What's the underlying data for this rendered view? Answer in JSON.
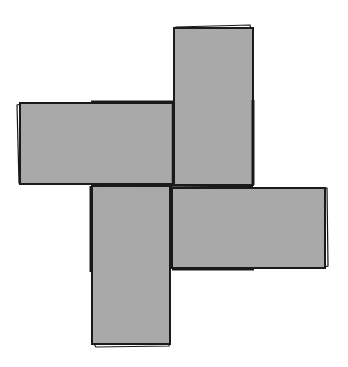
{
  "diagram": {
    "title": "",
    "colors": {
      "fill": "#a9a9a9",
      "stroke": "#1a1a1a",
      "background": "#ffffff",
      "shadow_edge": "#ffffff"
    },
    "rectangles": [
      {
        "id": "top",
        "x": 174,
        "y": 27,
        "w": 79,
        "h": 158
      },
      {
        "id": "left",
        "x": 19,
        "y": 103,
        "w": 154,
        "h": 81
      },
      {
        "id": "right",
        "x": 172,
        "y": 188,
        "w": 154,
        "h": 80
      },
      {
        "id": "bottom",
        "x": 92,
        "y": 186,
        "w": 78,
        "h": 159
      }
    ],
    "center": {
      "x": 172,
      "y": 186
    }
  }
}
